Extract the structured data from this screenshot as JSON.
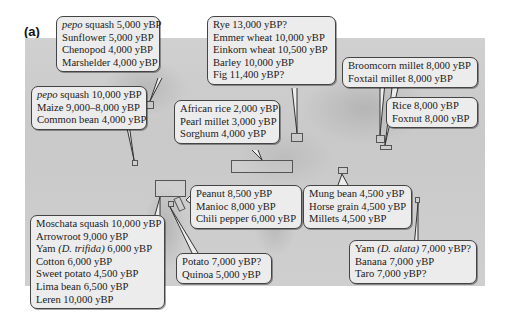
{
  "figure": {
    "panel_label": "(a)",
    "callouts": [
      {
        "id": "north-america",
        "lines": [
          {
            "italic": "pepo",
            "text": " squash 5,000 yBP"
          },
          {
            "text": "Sunflower 5,000 yBP"
          },
          {
            "text": "Chenopod 4,000 yBP"
          },
          {
            "text": "Marshelder 4,000 yBP"
          }
        ]
      },
      {
        "id": "mesoamerica",
        "lines": [
          {
            "italic": "pepo",
            "text": " squash 10,000 yBP"
          },
          {
            "text": "Maize 9,000–8,000 yBP"
          },
          {
            "text": "Common bean 4,000 yBP"
          }
        ]
      },
      {
        "id": "fertile-crescent",
        "lines": [
          {
            "text": "Rye 13,000 yBP?"
          },
          {
            "text": "Emmer wheat 10,000 yBP"
          },
          {
            "text": "Einkorn wheat 10,500 yBP"
          },
          {
            "text": "Barley 10,000 yBP"
          },
          {
            "text": "Fig 11,400 yBP?"
          }
        ]
      },
      {
        "id": "north-china",
        "lines": [
          {
            "text": "Broomcorn millet 8,000 yBP"
          },
          {
            "text": "Foxtail millet 8,000 yBP"
          }
        ]
      },
      {
        "id": "south-china",
        "lines": [
          {
            "text": "Rice 8,000 yBP"
          },
          {
            "text": "Foxnut 8,000 yBP"
          }
        ]
      },
      {
        "id": "sub-saharan-africa",
        "lines": [
          {
            "text": "African rice 2,000 yBP"
          },
          {
            "text": "Pearl millet 3,000 yBP"
          },
          {
            "text": "Sorghum 4,000 yBP"
          }
        ]
      },
      {
        "id": "eastern-south-america",
        "lines": [
          {
            "text": "Peanut 8,500 yBP"
          },
          {
            "text": "Manioc 8,000 yBP"
          },
          {
            "text": "Chili pepper 6,000 yBP"
          }
        ]
      },
      {
        "id": "india",
        "lines": [
          {
            "text": "Mung bean 4,500 yBP"
          },
          {
            "text": "Horse grain 4,500 yBP"
          },
          {
            "text": "Millets 4,500 yBP"
          }
        ]
      },
      {
        "id": "northern-south-america",
        "lines": [
          {
            "text": "Moschata squash 10,000 yBP"
          },
          {
            "text": "Arrowroot 9,000 yBP"
          },
          {
            "prefix": "Yam ",
            "italic": "(D. trifida)",
            "text": " 6,000 yBP"
          },
          {
            "text": "Cotton 6,000 yBP"
          },
          {
            "text": "Sweet potato 4,500 yBP"
          },
          {
            "text": "Lima bean 6,500 yBP"
          },
          {
            "text": "Leren 10,000 yBP"
          }
        ]
      },
      {
        "id": "andes",
        "lines": [
          {
            "text": "Potato 7,000 yBP?"
          },
          {
            "text": "Quinoa 5,000 yBP"
          }
        ]
      },
      {
        "id": "new-guinea",
        "lines": [
          {
            "prefix": "Yam ",
            "italic": "(D. alata)",
            "text": " 7,000 yBP?"
          },
          {
            "text": "Banana 7,000 yBP"
          },
          {
            "text": "Taro 7,000 yBP?"
          }
        ]
      }
    ]
  }
}
